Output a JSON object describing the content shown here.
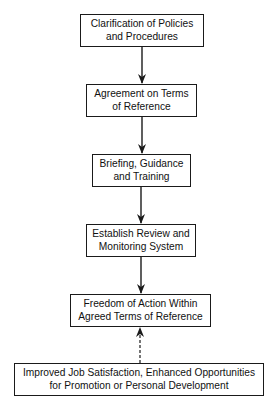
{
  "diagram": {
    "type": "flowchart",
    "nodes": [
      {
        "id": "n1",
        "line1": "Clarification of Policies",
        "line2": "and Procedures"
      },
      {
        "id": "n2",
        "line1": "Agreement on Terms",
        "line2": "of Reference"
      },
      {
        "id": "n3",
        "line1": "Briefing, Guidance",
        "line2": "and Training"
      },
      {
        "id": "n4",
        "line1": "Establish Review and",
        "line2": "Monitoring System"
      },
      {
        "id": "n5",
        "line1": "Freedom of Action Within",
        "line2": "Agreed Terms of Reference"
      },
      {
        "id": "n6",
        "line1": "Improved Job Satisfaction, Enhanced Opportunities",
        "line2": "for Promotion or Personal Development"
      }
    ],
    "edges": [
      {
        "from": "n1",
        "to": "n2",
        "style": "solid"
      },
      {
        "from": "n2",
        "to": "n3",
        "style": "solid"
      },
      {
        "from": "n3",
        "to": "n4",
        "style": "solid"
      },
      {
        "from": "n4",
        "to": "n5",
        "style": "solid"
      },
      {
        "from": "n6",
        "to": "n5",
        "style": "dashed"
      }
    ],
    "colors": {
      "line": "#1a1a1a",
      "background": "#ffffff"
    }
  }
}
